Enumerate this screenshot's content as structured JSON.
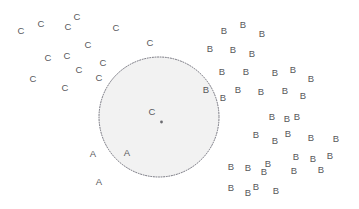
{
  "figure": {
    "background_color": "#ffffff",
    "width": 359,
    "height": 209
  },
  "region": {
    "name": "cluster-a-region",
    "label": "",
    "shape": "circle",
    "cx": 159,
    "cy": 117,
    "r": 60,
    "fill_color": "#f2f2f2",
    "stroke_color": "#70707a",
    "stroke_style": "dotted"
  },
  "center_marker": {
    "name": "region-center-dot",
    "x": 161.5,
    "y": 122,
    "r": 1.4,
    "color": "#6b6b70"
  },
  "chart_data": {
    "type": "scatter",
    "title": "",
    "subtitle": "",
    "xlabel": "",
    "ylabel": "",
    "grid": false,
    "axes_visible": false,
    "legend": false,
    "legend_position": "none",
    "xlim": [
      0,
      359
    ],
    "ylim": [
      0,
      209
    ],
    "note": "Point markers are drawn as class-letter glyphs (A, B, C) at pixel coordinates; y increases downward.",
    "label_color": "#58585c",
    "series": [
      {
        "name": "A",
        "label": "A",
        "marker": "A",
        "color": "#58585c",
        "count": 3,
        "points": [
          {
            "x": 93,
            "y": 154
          },
          {
            "x": 127,
            "y": 153
          },
          {
            "x": 99,
            "y": 182
          }
        ]
      },
      {
        "name": "B",
        "label": "B",
        "marker": "B",
        "color": "#58585c",
        "count": 38,
        "points": [
          {
            "x": 224,
            "y": 31
          },
          {
            "x": 243,
            "y": 25
          },
          {
            "x": 262,
            "y": 34
          },
          {
            "x": 210,
            "y": 49
          },
          {
            "x": 233,
            "y": 50
          },
          {
            "x": 252,
            "y": 54
          },
          {
            "x": 222,
            "y": 72
          },
          {
            "x": 246,
            "y": 72
          },
          {
            "x": 275,
            "y": 73
          },
          {
            "x": 293,
            "y": 70
          },
          {
            "x": 311,
            "y": 79
          },
          {
            "x": 206,
            "y": 90
          },
          {
            "x": 238,
            "y": 90
          },
          {
            "x": 261,
            "y": 92
          },
          {
            "x": 285,
            "y": 91
          },
          {
            "x": 303,
            "y": 96
          },
          {
            "x": 223,
            "y": 98
          },
          {
            "x": 272,
            "y": 117
          },
          {
            "x": 297,
            "y": 117
          },
          {
            "x": 256,
            "y": 135
          },
          {
            "x": 275,
            "y": 141
          },
          {
            "x": 288,
            "y": 134
          },
          {
            "x": 311,
            "y": 138
          },
          {
            "x": 336,
            "y": 139
          },
          {
            "x": 248,
            "y": 168
          },
          {
            "x": 268,
            "y": 164
          },
          {
            "x": 294,
            "y": 171
          },
          {
            "x": 296,
            "y": 157
          },
          {
            "x": 313,
            "y": 159
          },
          {
            "x": 330,
            "y": 156
          },
          {
            "x": 231,
            "y": 167
          },
          {
            "x": 231,
            "y": 188
          },
          {
            "x": 256,
            "y": 187
          },
          {
            "x": 276,
            "y": 191
          },
          {
            "x": 248,
            "y": 193
          },
          {
            "x": 287,
            "y": 119
          },
          {
            "x": 264,
            "y": 172
          },
          {
            "x": 321,
            "y": 170
          }
        ]
      },
      {
        "name": "C",
        "label": "C",
        "marker": "C",
        "color": "#58585c",
        "count": 17,
        "points": [
          {
            "x": 21,
            "y": 31
          },
          {
            "x": 41,
            "y": 24
          },
          {
            "x": 68,
            "y": 27
          },
          {
            "x": 77,
            "y": 17
          },
          {
            "x": 116,
            "y": 28
          },
          {
            "x": 88,
            "y": 45
          },
          {
            "x": 48,
            "y": 58
          },
          {
            "x": 67,
            "y": 56
          },
          {
            "x": 150,
            "y": 43
          },
          {
            "x": 79,
            "y": 70
          },
          {
            "x": 103,
            "y": 63
          },
          {
            "x": 99,
            "y": 78
          },
          {
            "x": 33,
            "y": 79
          },
          {
            "x": 65,
            "y": 88
          },
          {
            "x": 152,
            "y": 112
          }
        ]
      }
    ]
  }
}
